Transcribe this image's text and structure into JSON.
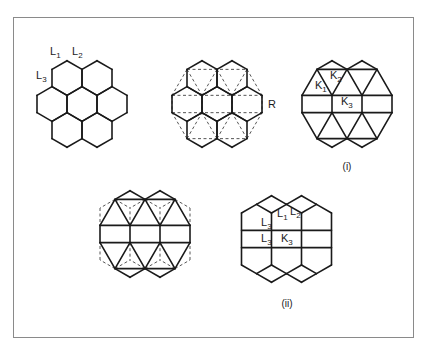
{
  "figure": {
    "frame_color": "#8a8a8a",
    "line_color": "#1a1a1a",
    "hex": {
      "half_width": 15,
      "radius": 17.32
    },
    "panels": [
      {
        "id": "hex-lattice",
        "center": [
          82,
          104
        ],
        "style": "hexagons"
      },
      {
        "id": "hex-lattice-with-dashed-triangulation",
        "center": [
          217,
          104
        ],
        "style": "hexagons-dashed-triangles"
      },
      {
        "id": "panel-i",
        "center": [
          347,
          104
        ],
        "style": "triangulated"
      },
      {
        "id": "triangulated-with-dashed-hexes",
        "center": [
          145,
          234
        ],
        "style": "triangulated-dashed"
      },
      {
        "id": "panel-ii",
        "center": [
          286.5,
          239
        ],
        "style": "rhombic"
      }
    ],
    "labels": [
      {
        "id": "label-L1-panel1",
        "main": "L",
        "sub": "1",
        "x": 50,
        "y": 55
      },
      {
        "id": "label-L2-panel1",
        "main": "L",
        "sub": "2",
        "x": 72,
        "y": 55
      },
      {
        "id": "label-L3-panel1",
        "main": "L",
        "sub": "3",
        "x": 36,
        "y": 79
      },
      {
        "id": "label-R",
        "main": "R",
        "sub": "",
        "x": 268,
        "y": 108
      },
      {
        "id": "label-K1-panel-i",
        "main": "K",
        "sub": "1",
        "x": 315,
        "y": 89
      },
      {
        "id": "label-K2-panel-i",
        "main": "K",
        "sub": "2",
        "x": 330,
        "y": 79
      },
      {
        "id": "label-K3-panel-i",
        "main": "K",
        "sub": "3",
        "x": 341,
        "y": 105
      },
      {
        "id": "label-L1-panel-ii",
        "main": "L",
        "sub": "1",
        "x": 277,
        "y": 217
      },
      {
        "id": "label-L2-panel-ii",
        "main": "L",
        "sub": "2",
        "x": 290,
        "y": 215
      },
      {
        "id": "label-L3a-panel-ii",
        "main": "L",
        "sub": "3",
        "x": 261,
        "y": 226
      },
      {
        "id": "label-L3b-panel-ii",
        "main": "L",
        "sub": "3",
        "x": 261,
        "y": 242
      },
      {
        "id": "label-K3-panel-ii",
        "main": "K",
        "sub": "3",
        "x": 281,
        "y": 242
      }
    ],
    "captions": [
      {
        "id": "caption-i",
        "text": "(i)",
        "x": 347,
        "y": 170
      },
      {
        "id": "caption-ii",
        "text": "(ii)",
        "x": 287,
        "y": 307
      }
    ]
  }
}
